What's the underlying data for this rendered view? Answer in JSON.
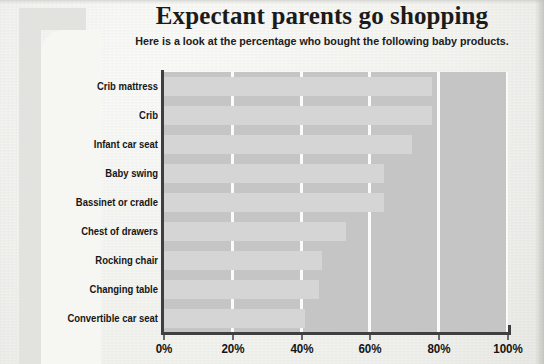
{
  "header": {
    "title": "Expectant parents go shopping",
    "subtitle": "Here is a look at the percentage who bought the following baby products."
  },
  "colors": {
    "page_background": "#f6f6f3",
    "plot_background": "#c5c5c5",
    "bar_fill": "#d5d5d5",
    "gridline": "#fbfbfb",
    "axis_line": "#3f3f3f",
    "text": "#161616",
    "decor_band": "#e2e2df"
  },
  "chart_data": {
    "type": "bar",
    "orientation": "horizontal",
    "title": "Expectant parents go shopping",
    "subtitle": "Here is a look at the percentage who bought the following baby products.",
    "xlabel": "",
    "ylabel": "",
    "xlim": [
      0,
      100
    ],
    "unit": "%",
    "grid": "vertical",
    "legend": "none",
    "xticks": [
      0,
      20,
      40,
      60,
      80,
      100
    ],
    "xtick_labels": [
      "0%",
      "20%",
      "40%",
      "60%",
      "80%",
      "100%"
    ],
    "categories": [
      "Crib mattress",
      "Crib",
      "Infant car seat",
      "Baby swing",
      "Bassinet or cradle",
      "Chest of drawers",
      "Rocking chair",
      "Changing table",
      "Convertible car seat"
    ],
    "values": [
      78,
      78,
      72,
      64,
      64,
      53,
      46,
      45,
      41
    ]
  }
}
